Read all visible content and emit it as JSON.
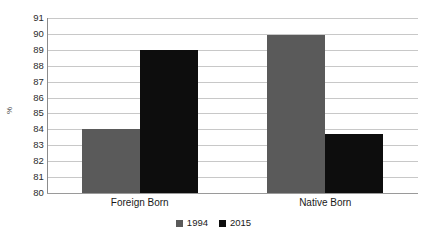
{
  "chart_data": {
    "type": "bar",
    "title": "",
    "subtitle": "",
    "xlabel": "",
    "ylabel": "%",
    "categories": [
      "Foreign Born",
      "Native Born"
    ],
    "series": [
      {
        "name": "1994",
        "color": "#5a5a5a",
        "values": [
          84.05,
          89.95
        ]
      },
      {
        "name": "2015",
        "color": "#0d0d0d",
        "values": [
          89.0,
          83.7
        ]
      }
    ],
    "ylim": [
      80,
      91
    ],
    "ytick_step": 1,
    "yticks": [
      91,
      90,
      89,
      88,
      87,
      86,
      85,
      84,
      83,
      82,
      81,
      80
    ],
    "grid": true,
    "legend_position": "bottom-center"
  },
  "axis": {
    "y_title": "%",
    "gridline_color": "#c8c8c8",
    "baseline_color": "#9a9a9a"
  },
  "legend": {
    "items": [
      {
        "label": "1994",
        "color": "#5a5a5a"
      },
      {
        "label": "2015",
        "color": "#0d0d0d"
      }
    ]
  }
}
